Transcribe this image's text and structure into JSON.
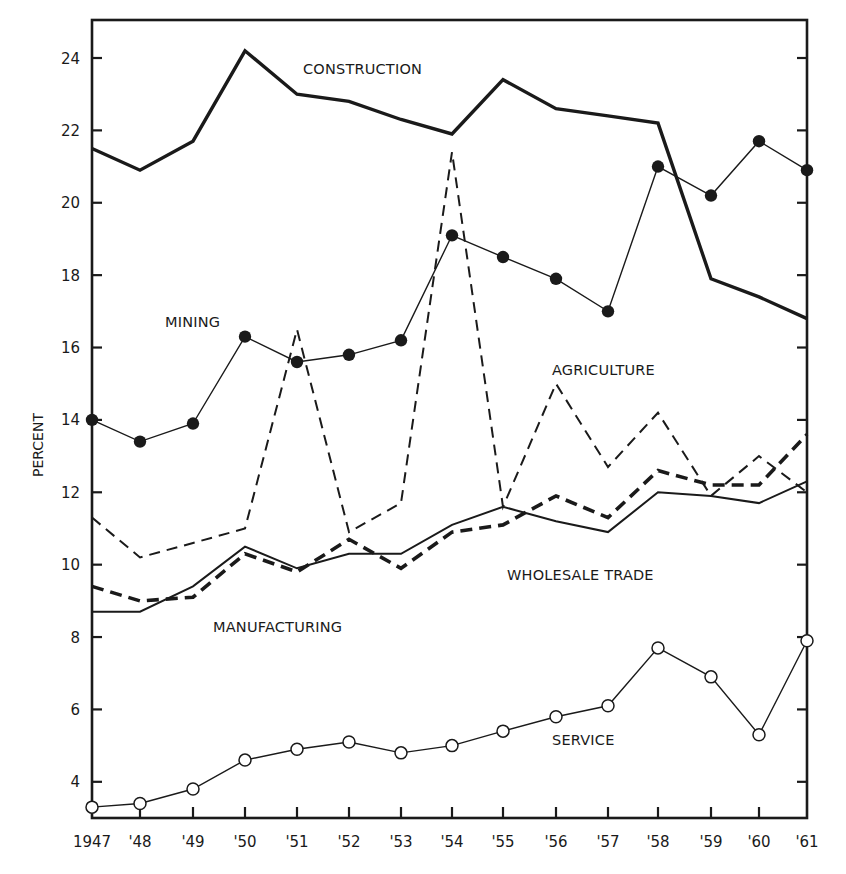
{
  "chart_data": {
    "type": "line",
    "title": "",
    "xlabel": "",
    "ylabel": "PERCENT",
    "x": [
      "1947",
      "'48",
      "'49",
      "'50",
      "'51",
      "'52",
      "'53",
      "'54",
      "'55",
      "'56",
      "'57",
      "'58",
      "'59",
      "'60",
      "'61"
    ],
    "x_positions": [
      92,
      140,
      193,
      245,
      297,
      349,
      401,
      452,
      503,
      556,
      608,
      658,
      711,
      759,
      807
    ],
    "ylim": [
      3,
      25.05
    ],
    "yticks": [
      4,
      6,
      8,
      10,
      12,
      14,
      16,
      18,
      20,
      22,
      24
    ],
    "grid": false,
    "legend": "inline labels",
    "series": [
      {
        "name": "CONSTRUCTION",
        "style": "thick-solid",
        "values": [
          21.5,
          20.9,
          21.7,
          24.2,
          23.0,
          22.8,
          22.3,
          21.9,
          23.4,
          22.6,
          22.4,
          22.2,
          17.9,
          17.4,
          16.8
        ],
        "label_pos": [
          303,
          74
        ]
      },
      {
        "name": "MINING",
        "style": "thin-solid-filled-dots",
        "values": [
          14.0,
          13.4,
          13.9,
          16.3,
          15.6,
          15.8,
          16.2,
          19.1,
          18.5,
          17.9,
          17.0,
          21.0,
          20.2,
          21.7,
          20.9
        ],
        "label_pos": [
          165,
          327
        ]
      },
      {
        "name": "AGRICULTURE",
        "style": "thin-dashed",
        "values": [
          11.3,
          10.2,
          10.6,
          11.0,
          16.5,
          10.9,
          11.7,
          21.4,
          11.6,
          15.0,
          12.7,
          14.2,
          11.9,
          13.0,
          12.0
        ],
        "label_pos": [
          552,
          375
        ]
      },
      {
        "name": "WHOLESALE TRADE",
        "style": "thick-dashed",
        "values": [
          9.4,
          9.0,
          9.1,
          10.3,
          9.8,
          10.7,
          9.9,
          10.9,
          11.1,
          11.9,
          11.3,
          12.6,
          12.2,
          12.2,
          13.6
        ],
        "label_pos": [
          507,
          580
        ]
      },
      {
        "name": "MANUFACTURING",
        "style": "thin-solid",
        "values": [
          8.7,
          8.7,
          9.4,
          10.5,
          9.9,
          10.3,
          10.3,
          11.1,
          11.6,
          11.2,
          10.9,
          12.0,
          11.9,
          11.7,
          12.3
        ],
        "label_pos": [
          213,
          632
        ]
      },
      {
        "name": "SERVICE",
        "style": "thin-solid-open-circles",
        "values": [
          3.3,
          3.4,
          3.8,
          4.6,
          4.9,
          5.1,
          4.8,
          5.0,
          5.4,
          5.8,
          6.1,
          7.7,
          6.9,
          5.3,
          7.9
        ],
        "label_pos": [
          552,
          745
        ]
      }
    ],
    "colors": {
      "ink": "#1a1a1a",
      "paper": "#ffffff"
    }
  },
  "plot_frame": {
    "left": 92,
    "right": 807,
    "top": 20,
    "bottom": 818
  }
}
